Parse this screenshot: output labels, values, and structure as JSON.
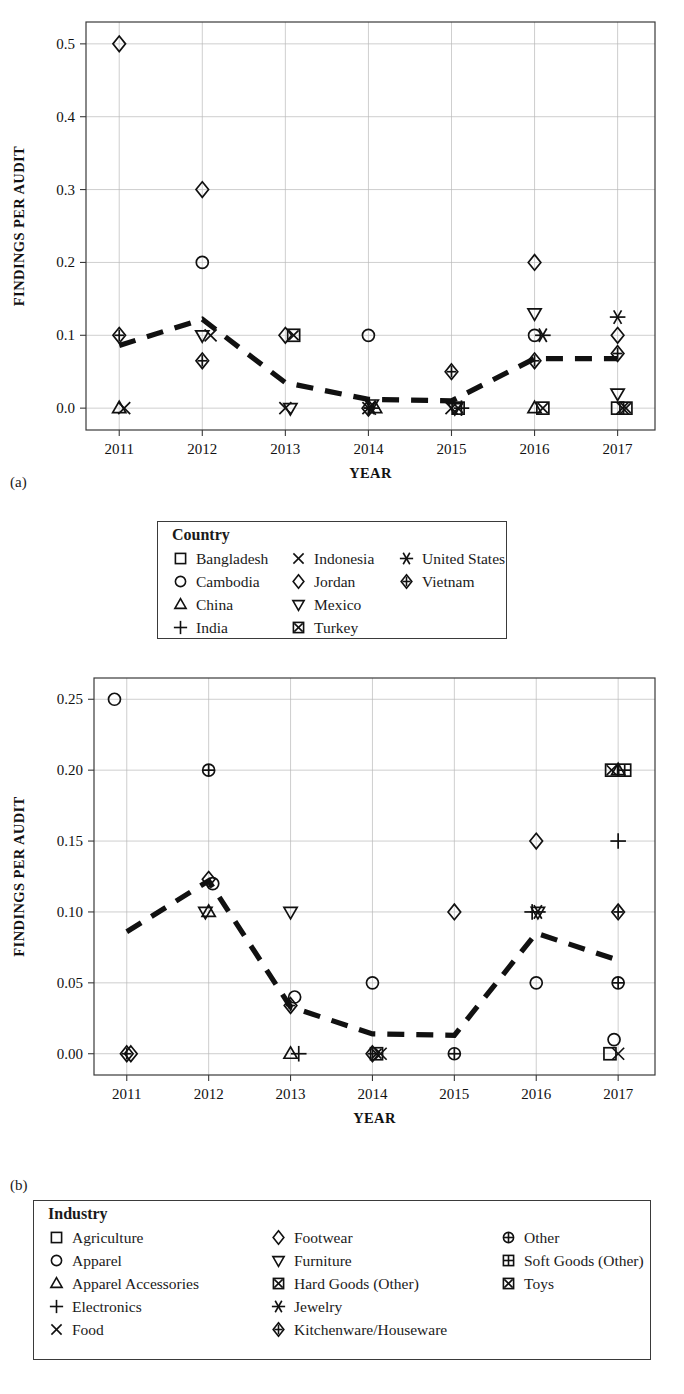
{
  "figure": {
    "panel_a_label": "(a)",
    "panel_b_label": "(b)"
  },
  "chart_data": [
    {
      "type": "scatter",
      "panel": "a",
      "title": "",
      "xlabel": "YEAR",
      "ylabel": "FINDINGS PER AUDIT",
      "x": [
        2011,
        2012,
        2013,
        2014,
        2015,
        2016,
        2017
      ],
      "xlim": [
        2010.6,
        2017.45
      ],
      "ylim": [
        -0.03,
        0.53
      ],
      "yticks": [
        0.0,
        0.1,
        0.2,
        0.3,
        0.4,
        0.5
      ],
      "ytick_labels": [
        "0.0",
        "0.1",
        "0.2",
        "0.3",
        "0.4",
        "0.5"
      ],
      "xtick_labels": [
        "2011",
        "2012",
        "2013",
        "2014",
        "2015",
        "2016",
        "2017"
      ],
      "grid": true,
      "legend_position": "below",
      "legend_title": "Country",
      "series": [
        {
          "name": "Bangladesh",
          "marker": "square",
          "points": [
            [
              2017.0,
              0.0
            ]
          ]
        },
        {
          "name": "Cambodia",
          "marker": "circle",
          "points": [
            [
              2012.0,
              0.2
            ],
            [
              2014.0,
              0.1
            ],
            [
              2016.0,
              0.1
            ]
          ]
        },
        {
          "name": "China",
          "marker": "triangle-up",
          "points": [
            [
              2011.0,
              0.0
            ],
            [
              2014.08,
              0.0
            ],
            [
              2016.0,
              0.0
            ]
          ]
        },
        {
          "name": "India",
          "marker": "plus",
          "points": [
            [
              2015.12,
              0.0
            ]
          ]
        },
        {
          "name": "Indonesia",
          "marker": "cross",
          "points": [
            [
              2011.06,
              0.0
            ],
            [
              2012.1,
              0.1
            ],
            [
              2013.0,
              0.0
            ],
            [
              2014.0,
              0.0
            ],
            [
              2015.0,
              0.0
            ],
            [
              2017.06,
              0.0
            ]
          ]
        },
        {
          "name": "Jordan",
          "marker": "diamond",
          "points": [
            [
              2011.0,
              0.5
            ],
            [
              2012.0,
              0.3
            ],
            [
              2013.0,
              0.1
            ],
            [
              2016.0,
              0.2
            ],
            [
              2017.0,
              0.1
            ]
          ]
        },
        {
          "name": "Mexico",
          "marker": "triangle-down",
          "points": [
            [
              2012.0,
              0.1
            ],
            [
              2013.06,
              0.0
            ],
            [
              2014.04,
              0.005
            ],
            [
              2015.04,
              0.0
            ],
            [
              2016.0,
              0.13
            ],
            [
              2017.0,
              0.02
            ]
          ]
        },
        {
          "name": "Turkey",
          "marker": "boxed-x",
          "points": [
            [
              2013.1,
              0.1
            ],
            [
              2015.08,
              0.0
            ],
            [
              2016.1,
              0.0
            ],
            [
              2017.1,
              0.0
            ]
          ]
        },
        {
          "name": "United States",
          "marker": "asterisk",
          "points": [
            [
              2014.04,
              0.0
            ],
            [
              2016.1,
              0.1
            ],
            [
              2017.0,
              0.125
            ]
          ]
        },
        {
          "name": "Vietnam",
          "marker": "crossed-diamond",
          "points": [
            [
              2011.0,
              0.1
            ],
            [
              2012.0,
              0.065
            ],
            [
              2014.0,
              0.0
            ],
            [
              2015.0,
              0.05
            ],
            [
              2016.0,
              0.065
            ],
            [
              2017.0,
              0.075
            ]
          ]
        }
      ],
      "trend_line": {
        "label": "mean findings per audit",
        "style": "dashed",
        "x": [
          2011,
          2012,
          2013,
          2014,
          2015,
          2016,
          2017
        ],
        "y": [
          0.086,
          0.122,
          0.035,
          0.012,
          0.01,
          0.068,
          0.068
        ]
      }
    },
    {
      "type": "scatter",
      "panel": "b",
      "title": "",
      "xlabel": "YEAR",
      "ylabel": "FINDINGS PER AUDIT",
      "x": [
        2011,
        2012,
        2013,
        2014,
        2015,
        2016,
        2017
      ],
      "xlim": [
        2010.6,
        2017.45
      ],
      "ylim": [
        -0.015,
        0.265
      ],
      "yticks": [
        0.0,
        0.05,
        0.1,
        0.15,
        0.2,
        0.25
      ],
      "ytick_labels": [
        "0.00",
        "0.05",
        "0.10",
        "0.15",
        "0.20",
        "0.25"
      ],
      "xtick_labels": [
        "2011",
        "2012",
        "2013",
        "2014",
        "2015",
        "2016",
        "2017"
      ],
      "grid": true,
      "legend_position": "below",
      "legend_title": "Industry",
      "series": [
        {
          "name": "Agriculture",
          "marker": "square",
          "points": [
            [
              2016.9,
              0.0
            ]
          ]
        },
        {
          "name": "Apparel",
          "marker": "circle",
          "points": [
            [
              2010.85,
              0.25
            ],
            [
              2012.05,
              0.12
            ],
            [
              2013.05,
              0.04
            ],
            [
              2014.0,
              0.05
            ],
            [
              2016.0,
              0.05
            ],
            [
              2016.95,
              0.01
            ]
          ]
        },
        {
          "name": "Apparel Accessories",
          "marker": "triangle-up",
          "points": [
            [
              2012.0,
              0.1
            ],
            [
              2013.0,
              0.0
            ],
            [
              2017.0,
              0.2
            ]
          ]
        },
        {
          "name": "Electronics",
          "marker": "plus",
          "points": [
            [
              2013.1,
              0.0
            ],
            [
              2015.95,
              0.1
            ],
            [
              2017.0,
              0.15
            ]
          ]
        },
        {
          "name": "Food",
          "marker": "cross",
          "points": [
            [
              2014.1,
              0.0
            ],
            [
              2017.0,
              0.0
            ]
          ]
        },
        {
          "name": "Footwear",
          "marker": "diamond",
          "points": [
            [
              2011.05,
              0.0
            ],
            [
              2012.0,
              0.123
            ],
            [
              2015.0,
              0.1
            ],
            [
              2016.0,
              0.15
            ]
          ]
        },
        {
          "name": "Furniture",
          "marker": "triangle-down",
          "points": [
            [
              2011.96,
              0.1
            ],
            [
              2013.0,
              0.1
            ],
            [
              2016.02,
              0.1
            ]
          ]
        },
        {
          "name": "Hard Goods (Other)",
          "marker": "boxed-x",
          "points": [
            [
              2014.05,
              0.0
            ]
          ]
        },
        {
          "name": "Jewelry",
          "marker": "asterisk",
          "points": [
            [
              2016.02,
              0.1
            ]
          ]
        },
        {
          "name": "Kitchenware/Houseware",
          "marker": "crossed-diamond",
          "points": [
            [
              2011.0,
              0.0
            ],
            [
              2013.0,
              0.034
            ],
            [
              2014.0,
              0.0
            ],
            [
              2017.0,
              0.1
            ]
          ]
        },
        {
          "name": "Other",
          "marker": "circle-plus",
          "points": [
            [
              2012.0,
              0.2
            ],
            [
              2015.0,
              0.0
            ],
            [
              2017.0,
              0.05
            ]
          ]
        },
        {
          "name": "Soft Goods (Other)",
          "marker": "boxed-plus",
          "points": [
            [
              2017.08,
              0.2
            ]
          ]
        },
        {
          "name": "Toys",
          "marker": "boxed-x",
          "points": [
            [
              2016.92,
              0.2
            ]
          ]
        }
      ],
      "trend_line": {
        "label": "mean findings per audit",
        "style": "dashed",
        "x": [
          2011,
          2012,
          2013,
          2014,
          2015,
          2016,
          2017
        ],
        "y": [
          0.086,
          0.122,
          0.033,
          0.014,
          0.013,
          0.085,
          0.066
        ]
      }
    }
  ],
  "legend_a": {
    "title": "Country",
    "columns": [
      [
        {
          "label": "Bangladesh",
          "marker": "square"
        },
        {
          "label": "Cambodia",
          "marker": "circle"
        },
        {
          "label": "China",
          "marker": "triangle-up"
        },
        {
          "label": "India",
          "marker": "plus"
        }
      ],
      [
        {
          "label": "Indonesia",
          "marker": "cross"
        },
        {
          "label": "Jordan",
          "marker": "diamond"
        },
        {
          "label": "Mexico",
          "marker": "triangle-down"
        },
        {
          "label": "Turkey",
          "marker": "boxed-x"
        }
      ],
      [
        {
          "label": "United States",
          "marker": "asterisk"
        },
        {
          "label": "Vietnam",
          "marker": "crossed-diamond"
        }
      ]
    ]
  },
  "legend_b": {
    "title": "Industry",
    "columns": [
      [
        {
          "label": "Agriculture",
          "marker": "square"
        },
        {
          "label": "Apparel",
          "marker": "circle"
        },
        {
          "label": "Apparel Accessories",
          "marker": "triangle-up"
        },
        {
          "label": "Electronics",
          "marker": "plus"
        },
        {
          "label": "Food",
          "marker": "cross"
        }
      ],
      [
        {
          "label": "Footwear",
          "marker": "diamond"
        },
        {
          "label": "Furniture",
          "marker": "triangle-down"
        },
        {
          "label": "Hard Goods (Other)",
          "marker": "boxed-x"
        },
        {
          "label": "Jewelry",
          "marker": "asterisk"
        },
        {
          "label": "Kitchenware/Houseware",
          "marker": "crossed-diamond"
        }
      ],
      [
        {
          "label": "Other",
          "marker": "circle-plus"
        },
        {
          "label": "Soft Goods (Other)",
          "marker": "boxed-plus"
        },
        {
          "label": "Toys",
          "marker": "boxed-x"
        }
      ]
    ]
  }
}
